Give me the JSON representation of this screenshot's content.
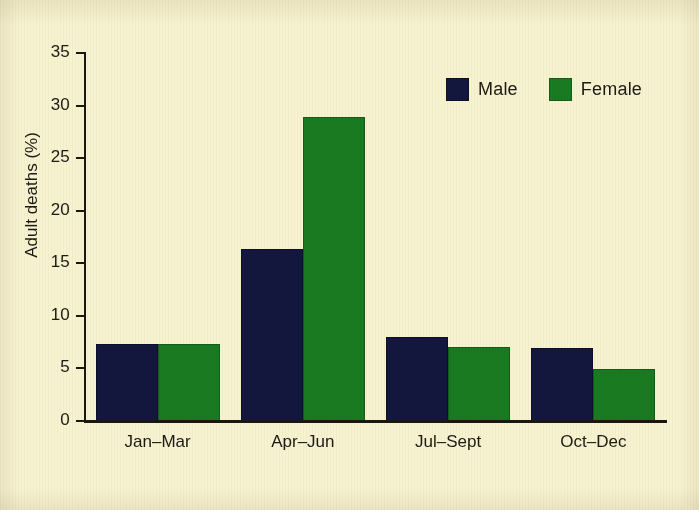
{
  "chart_data": {
    "type": "bar",
    "title": "",
    "xlabel": "",
    "ylabel": "Adult deaths (%)",
    "categories": [
      "Jan–Mar",
      "Apr–Jun",
      "Jul–Sept",
      "Oct–Dec"
    ],
    "series": [
      {
        "name": "Male",
        "color": "#14173d",
        "values": [
          7.4,
          16.5,
          8.1,
          7.0
        ]
      },
      {
        "name": "Female",
        "color": "#1a7a22",
        "values": [
          7.4,
          29.0,
          7.1,
          5.0
        ]
      }
    ],
    "ylim": [
      0,
      35
    ],
    "ytick_values": [
      0,
      5,
      10,
      15,
      20,
      25,
      30,
      35
    ],
    "ytick_labels": [
      "0",
      "5",
      "10",
      "15",
      "20",
      "25",
      "30",
      "35"
    ],
    "grid": false,
    "legend_position": "top-right",
    "legend_entries": [
      "Male",
      "Female"
    ]
  },
  "axes": {
    "y_title": "Adult deaths (%)",
    "ticks": [
      {
        "label": "35",
        "value": 35
      },
      {
        "label": "30",
        "value": 30
      },
      {
        "label": "25",
        "value": 25
      },
      {
        "label": "20",
        "value": 20
      },
      {
        "label": "15",
        "value": 15
      },
      {
        "label": "10",
        "value": 10
      },
      {
        "label": "5",
        "value": 5
      },
      {
        "label": "0",
        "value": 0
      }
    ]
  },
  "groups": [
    {
      "label": "Jan–Mar",
      "male": 7.4,
      "female": 7.4
    },
    {
      "label": "Apr–Jun",
      "male": 16.5,
      "female": 29.0
    },
    {
      "label": "Jul–Sept",
      "male": 8.1,
      "female": 7.1
    },
    {
      "label": "Oct–Dec",
      "male": 7.0,
      "female": 5.0
    }
  ],
  "legend": {
    "male_label": "Male",
    "female_label": "Female"
  },
  "colors": {
    "male": "#14173d",
    "female": "#1a7a22",
    "background": "#f7f2d0",
    "axis": "#191712",
    "text": "#1b1a16"
  }
}
